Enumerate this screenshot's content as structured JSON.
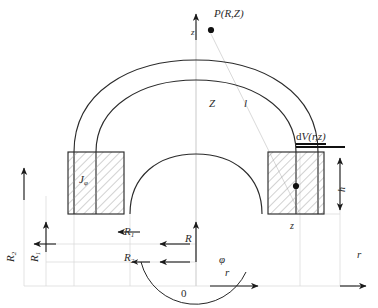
{
  "figure": {
    "type": "technical-diagram",
    "background_color": "#ffffff",
    "stroke_color": "#2b2b2b",
    "hatch_color": "#8c8c8c",
    "guide_color": "#d8d8d8",
    "width": 378,
    "height": 308
  },
  "labels": {
    "field_point": "P(R,Z)",
    "field_point_marker": "point-dot",
    "axis_z_top": "z",
    "distance_Z": "Z",
    "distance_l": "l",
    "volume_element": "dV(r,z)",
    "current_density": "J",
    "current_density_subscript": "φ",
    "inner_radius": "R",
    "inner_radius_subscript": "1",
    "outer_radius": "R",
    "outer_radius_subscript": "2",
    "radial_R": "R",
    "radial_r_lower": "r",
    "axial_z_lower": "z",
    "height_h": "h",
    "angle_phi": "φ",
    "axis_r_right": "r",
    "origin": "0",
    "left_axis_outer": "R",
    "left_axis_outer_subscript": "2",
    "left_axis_inner": "R",
    "left_axis_inner_subscript": "1"
  }
}
